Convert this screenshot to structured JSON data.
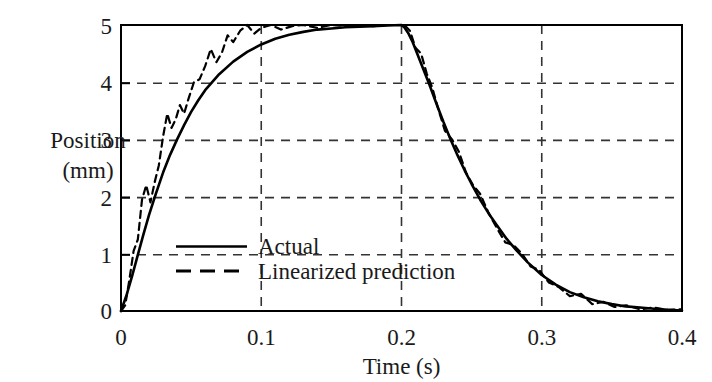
{
  "chart_data": {
    "type": "line",
    "title": "",
    "xlabel": "Time (s)",
    "ylabel_line1": "Position",
    "ylabel_line2": "(mm)",
    "xlim": [
      0,
      0.4
    ],
    "ylim": [
      0,
      5
    ],
    "xticks": [
      0,
      0.1,
      0.2,
      0.3,
      0.4
    ],
    "xtick_labels": [
      "0",
      "0.1",
      "0.2",
      "0.3",
      "0.4"
    ],
    "yticks": [
      0,
      1,
      2,
      3,
      4,
      5
    ],
    "ytick_labels": [
      "0",
      "1",
      "2",
      "3",
      "4",
      "5"
    ],
    "grid": "dashed-both-axes",
    "legend_position": "center-left-inside",
    "line_color": "#000000",
    "grid_color": "#333333",
    "frame_color": "#000000",
    "series": [
      {
        "name": "Actual",
        "style": "solid",
        "x": [
          0.0,
          0.004,
          0.008,
          0.012,
          0.016,
          0.02,
          0.025,
          0.03,
          0.035,
          0.04,
          0.045,
          0.05,
          0.055,
          0.06,
          0.065,
          0.07,
          0.08,
          0.09,
          0.1,
          0.11,
          0.12,
          0.13,
          0.14,
          0.15,
          0.16,
          0.17,
          0.18,
          0.19,
          0.2,
          0.202,
          0.205,
          0.208,
          0.212,
          0.216,
          0.22,
          0.225,
          0.23,
          0.235,
          0.24,
          0.245,
          0.25,
          0.256,
          0.262,
          0.268,
          0.275,
          0.282,
          0.29,
          0.3,
          0.31,
          0.32,
          0.33,
          0.34,
          0.35,
          0.36,
          0.37,
          0.38,
          0.39,
          0.4
        ],
        "y": [
          0.0,
          0.28,
          0.62,
          0.98,
          1.34,
          1.68,
          2.06,
          2.42,
          2.73,
          3.0,
          3.25,
          3.48,
          3.68,
          3.86,
          4.0,
          4.14,
          4.36,
          4.53,
          4.66,
          4.76,
          4.83,
          4.88,
          4.92,
          4.94,
          4.96,
          4.97,
          4.98,
          4.99,
          5.0,
          4.96,
          4.85,
          4.7,
          4.45,
          4.2,
          3.95,
          3.62,
          3.3,
          3.0,
          2.72,
          2.46,
          2.22,
          1.95,
          1.71,
          1.5,
          1.26,
          1.06,
          0.85,
          0.63,
          0.46,
          0.33,
          0.24,
          0.17,
          0.12,
          0.08,
          0.06,
          0.04,
          0.02,
          0.01
        ],
        "description": "Measured actual position step response"
      },
      {
        "name": "Linearized prediction",
        "style": "dashed",
        "x": [
          0.0,
          0.003,
          0.006,
          0.009,
          0.012,
          0.015,
          0.018,
          0.021,
          0.024,
          0.027,
          0.03,
          0.033,
          0.036,
          0.039,
          0.042,
          0.045,
          0.048,
          0.052,
          0.056,
          0.06,
          0.064,
          0.068,
          0.072,
          0.076,
          0.08,
          0.085,
          0.09,
          0.095,
          0.1,
          0.107,
          0.114,
          0.122,
          0.13,
          0.14,
          0.15,
          0.16,
          0.17,
          0.18,
          0.19,
          0.2,
          0.202,
          0.206,
          0.21,
          0.214,
          0.218,
          0.222,
          0.226,
          0.231,
          0.236,
          0.241,
          0.246,
          0.251,
          0.256,
          0.262,
          0.268,
          0.274,
          0.28,
          0.286,
          0.292,
          0.298,
          0.305,
          0.312,
          0.32,
          0.328,
          0.336,
          0.344,
          0.352,
          0.36,
          0.37,
          0.38,
          0.39,
          0.4
        ],
        "y": [
          0.0,
          0.1,
          0.55,
          1.05,
          1.25,
          1.95,
          2.2,
          1.9,
          2.25,
          2.55,
          3.05,
          3.45,
          3.2,
          3.35,
          3.6,
          3.45,
          3.7,
          4.0,
          4.05,
          4.28,
          4.58,
          4.35,
          4.52,
          4.82,
          4.7,
          4.9,
          5.0,
          4.85,
          4.95,
          5.0,
          4.92,
          4.98,
          5.0,
          4.95,
          5.0,
          4.98,
          5.0,
          4.98,
          5.0,
          5.0,
          5.0,
          4.9,
          4.6,
          4.5,
          4.15,
          3.9,
          3.55,
          3.15,
          3.0,
          2.78,
          2.42,
          2.2,
          2.05,
          1.72,
          1.45,
          1.2,
          1.15,
          1.0,
          0.78,
          0.72,
          0.5,
          0.42,
          0.26,
          0.3,
          0.12,
          0.16,
          0.07,
          0.1,
          0.03,
          0.06,
          0.02,
          0.03
        ],
        "description": "Linearized model prediction, noisy"
      }
    ],
    "legend": [
      {
        "label": "Actual",
        "style": "solid"
      },
      {
        "label": "Linearized prediction",
        "style": "dashed"
      }
    ]
  }
}
